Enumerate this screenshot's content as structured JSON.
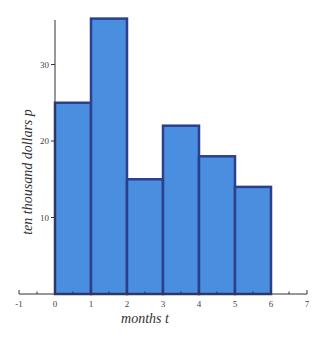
{
  "chart_data": {
    "type": "bar",
    "subtype": "histogram",
    "title": "",
    "xlabel": "months t",
    "ylabel": "ten thousand dollars p",
    "bins": [
      [
        0,
        1
      ],
      [
        1,
        2
      ],
      [
        2,
        3
      ],
      [
        3,
        4
      ],
      [
        4,
        5
      ],
      [
        5,
        6
      ]
    ],
    "categories": [
      "0-1",
      "1-2",
      "2-3",
      "3-4",
      "4-5",
      "5-6"
    ],
    "values": [
      25,
      36,
      15,
      22,
      18,
      14
    ],
    "xlim": [
      -1,
      7
    ],
    "ylim": [
      0,
      37
    ],
    "xticks": [
      -1,
      0,
      1,
      2,
      3,
      4,
      5,
      6,
      7
    ],
    "yticks": [
      10,
      20,
      30
    ],
    "grid": false,
    "legend": null,
    "colors": {
      "bar_fill": "#4a8ee0",
      "bar_edge": "#2c3f8e",
      "axis": "#333333"
    }
  }
}
